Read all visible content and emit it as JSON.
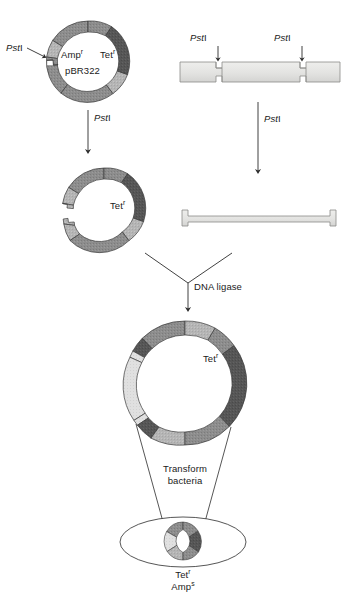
{
  "figure": {
    "enzyme_name_italic": "Pst",
    "enzyme_name_roman": "I"
  },
  "colors": {
    "plasmid_medium": "#8f8f8f",
    "plasmid_dark": "#4f4f4f",
    "plasmid_light": "#b9b9b9",
    "insert_light": "#e2e2e2",
    "dna_bar_fill": "#e4e4e2",
    "outline": "#3a3a3a",
    "text": "#1a1a1a",
    "background": "#ffffff"
  },
  "steps": {
    "parent_plasmid": {
      "name_label": "pBR322",
      "amp_label": "Amp",
      "amp_super": "r",
      "tet_label": "Tet",
      "tet_super": "r",
      "site_label_italic": "Pst",
      "site_label_roman": "I"
    },
    "donor_dna": {
      "site_left_italic": "Pst",
      "site_left_roman": "I",
      "site_right_italic": "Pst",
      "site_right_roman": "I"
    },
    "digest_plasmid_arrow": {
      "label_italic": "Pst",
      "label_roman": "I"
    },
    "digest_dna_arrow": {
      "label_italic": "Pst",
      "label_roman": "I"
    },
    "cut_plasmid": {
      "tet_label": "Tet",
      "tet_super": "r"
    },
    "ligation": {
      "label": "DNA ligase"
    },
    "recombinant_plasmid": {
      "tet_label": "Tet",
      "tet_super": "r"
    },
    "transformation": {
      "label_line1": "Transform",
      "label_line2": "bacteria"
    },
    "transformed_cell": {
      "tet_label": "Tet",
      "tet_super": "r",
      "amp_label": "Amp",
      "amp_super": "s"
    }
  }
}
